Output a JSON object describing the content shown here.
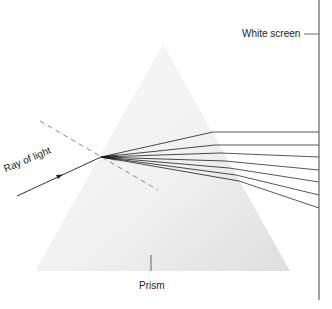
{
  "diagram": {
    "labels": {
      "white_screen": "White screen",
      "prism": "Prism",
      "ray_of_light": "Ray of light"
    },
    "colors": {
      "line": "#333333",
      "prism_fill_light": "#f7f7f7",
      "prism_fill_dark": "#e2e2e2",
      "dashed_normal": "#888888",
      "background": "#ffffff"
    },
    "prism": {
      "apex": [
        163,
        44
      ],
      "base_left": [
        35,
        271
      ],
      "base_right": [
        290,
        271
      ]
    },
    "screen": {
      "x": 319,
      "y_top": 0,
      "y_bottom": 300
    },
    "incident_ray": {
      "start": [
        17,
        196
      ],
      "entry": [
        101,
        157
      ]
    },
    "normal_line": {
      "start": [
        40,
        121
      ],
      "end": [
        158,
        190
      ]
    },
    "dispersed_rays": [
      {
        "exit": [
          213,
          132
        ],
        "screen_y": 132
      },
      {
        "exit": [
          215,
          145
        ],
        "screen_y": 145
      },
      {
        "exit": [
          220,
          153
        ],
        "screen_y": 157
      },
      {
        "exit": [
          225,
          161
        ],
        "screen_y": 170
      },
      {
        "exit": [
          229,
          168
        ],
        "screen_y": 182
      },
      {
        "exit": [
          236,
          175
        ],
        "screen_y": 195
      },
      {
        "exit": [
          239,
          181
        ],
        "screen_y": 208
      }
    ]
  }
}
